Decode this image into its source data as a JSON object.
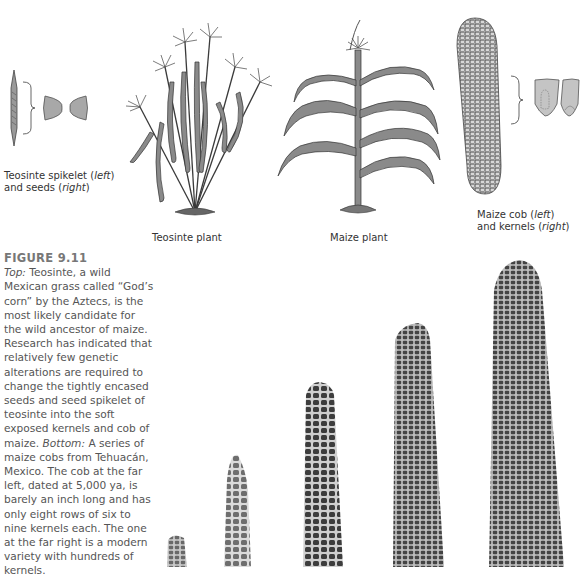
{
  "top_panel": {
    "labels": {
      "teosinte_spikelet": {
        "part1": "Teosinte spikelet (",
        "italic1": "left",
        "part2": ")",
        "line2a": "and seeds (",
        "italic2": "right",
        "line2b": ")"
      },
      "teosinte_plant": "Teosinte plant",
      "maize_plant": "Maize plant",
      "maize_cob": {
        "part1": "Maize cob (",
        "italic1": "left",
        "part2": ")",
        "line2a": "and kernels (",
        "italic2": "right",
        "line2b": ")"
      }
    }
  },
  "caption": {
    "figure_label": "FIGURE 9.11",
    "top_lead": "Top:",
    "top_text": " Teosinte, a wild Mexican grass called “God’s corn” by the Aztecs, is the most likely candidate for the wild ancestor of maize. Research has indicated that relatively few genetic alterations are required to change the tightly encased seeds and seed spikelet of teosinte into the soft exposed kernels and cob of maize. ",
    "bottom_lead": "Bottom:",
    "bottom_text": " A series of maize cobs from Tehuacán, Mexico. The cob at the far left, dated at 5,000 ya, is barely an inch long and has only eight rows of six to nine kernels each. The one at the far right is a modern variety with hundreds of kernels."
  },
  "bottom_panel": {
    "cobs": [
      "cob-1-ancient",
      "cob-2",
      "cob-3",
      "cob-4",
      "cob-5-modern"
    ]
  },
  "colors": {
    "illustration_fill": "#8a8a8a",
    "line": "#3a3a3a",
    "cob_dark": "#3d3d3d"
  }
}
